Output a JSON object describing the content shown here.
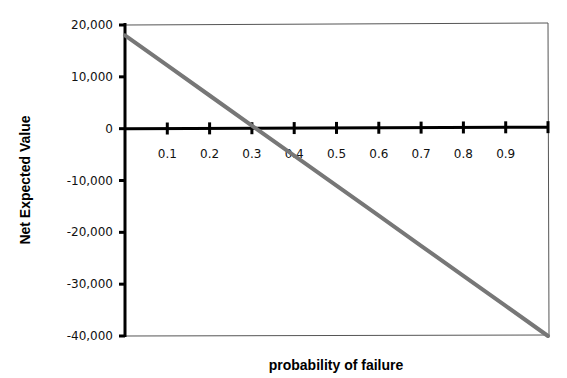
{
  "chart_data": {
    "type": "line",
    "title": "",
    "xlabel": "probability of failure",
    "ylabel": "Net Expected Value",
    "xlim": [
      0,
      1
    ],
    "ylim": [
      -40000,
      20000
    ],
    "x_ticks": [
      0.1,
      0.2,
      0.3,
      0.4,
      0.5,
      0.6,
      0.7,
      0.8,
      0.9
    ],
    "x_tick_labels": [
      "0.1",
      "0.2",
      "0.3",
      "0.4",
      "0.5",
      "0.6",
      "0.7",
      "0.8",
      "0.9"
    ],
    "y_ticks": [
      20000,
      10000,
      0,
      -10000,
      -20000,
      -30000,
      -40000
    ],
    "y_tick_labels": [
      "20,000",
      "10,000",
      "0",
      "-10,000",
      "-20,000",
      "-30,000",
      "-40,000"
    ],
    "grid": false,
    "legend": null,
    "series": [
      {
        "name": "Net Expected Value",
        "color": "#777777",
        "x": [
          0,
          0.1,
          0.2,
          0.3,
          0.31,
          0.4,
          0.5,
          0.6,
          0.7,
          0.8,
          0.9,
          1.0
        ],
        "values": [
          18000,
          12200,
          6400,
          600,
          0,
          -5200,
          -11000,
          -16800,
          -22600,
          -28400,
          -34200,
          -40000
        ]
      }
    ]
  },
  "colors": {
    "axis": "#000000",
    "frame": "#555555",
    "line": "#777777"
  }
}
